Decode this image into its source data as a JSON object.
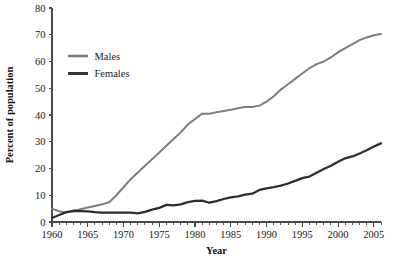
{
  "chart_data": {
    "type": "line",
    "title": "",
    "xlabel": "Year",
    "ylabel": "Percent of population",
    "xlim": [
      1960,
      2006
    ],
    "ylim": [
      0,
      80
    ],
    "ytick_values": [
      0,
      10,
      20,
      30,
      40,
      50,
      60,
      70,
      80
    ],
    "ytick_labels": [
      "0",
      "10",
      "20",
      "30",
      "40",
      "50",
      "60",
      "70",
      "80"
    ],
    "xtick_values": [
      1960,
      1965,
      1970,
      1975,
      1980,
      1985,
      1990,
      1995,
      2000,
      2005
    ],
    "xtick_labels": [
      "1960",
      "1965",
      "1970",
      "1975",
      "1980",
      "1985",
      "1990",
      "1995",
      "2000",
      "2005"
    ],
    "xtick_minor_step": 1,
    "grid": false,
    "legend_position": "upper-left-inside",
    "x": [
      1960,
      1961,
      1962,
      1963,
      1964,
      1965,
      1966,
      1967,
      1968,
      1969,
      1970,
      1971,
      1972,
      1973,
      1974,
      1975,
      1976,
      1977,
      1978,
      1979,
      1980,
      1981,
      1982,
      1983,
      1984,
      1985,
      1986,
      1987,
      1988,
      1989,
      1990,
      1991,
      1992,
      1993,
      1994,
      1995,
      1996,
      1997,
      1998,
      1999,
      2000,
      2001,
      2002,
      2003,
      2004,
      2005,
      2006
    ],
    "series": [
      {
        "name": "Males",
        "color": "#7d7d7d",
        "line_width": 2.0,
        "values": [
          5.0,
          4.0,
          3.5,
          4.0,
          4.8,
          5.4,
          6.0,
          6.6,
          7.4,
          10.0,
          13.0,
          16.0,
          18.5,
          21.0,
          23.5,
          26.0,
          28.5,
          31.0,
          33.5,
          36.5,
          38.5,
          40.5,
          40.5,
          41.0,
          41.5,
          42.0,
          42.5,
          43.0,
          43.0,
          43.5,
          45.0,
          47.0,
          49.5,
          51.5,
          53.5,
          55.5,
          57.5,
          59.0,
          60.0,
          61.5,
          63.5,
          65.0,
          66.5,
          68.0,
          69.0,
          69.8,
          70.3
        ]
      },
      {
        "name": "Females",
        "color": "#2e2e2e",
        "line_width": 2.3,
        "values": [
          1.5,
          2.6,
          3.7,
          4.2,
          4.1,
          4.0,
          3.7,
          3.5,
          3.5,
          3.5,
          3.5,
          3.5,
          3.2,
          3.8,
          4.6,
          5.3,
          6.4,
          6.2,
          6.6,
          7.4,
          7.9,
          8.0,
          7.2,
          7.8,
          8.6,
          9.2,
          9.6,
          10.2,
          10.6,
          12.0,
          12.6,
          13.0,
          13.6,
          14.4,
          15.4,
          16.4,
          17.0,
          18.4,
          19.8,
          21.0,
          22.5,
          23.8,
          24.5,
          25.6,
          26.8,
          28.2,
          29.4
        ]
      }
    ],
    "legend": [
      {
        "label": "Males",
        "color": "#7d7d7d"
      },
      {
        "label": "Females",
        "color": "#2e2e2e"
      }
    ]
  },
  "figure": {
    "background": "#ffffff"
  }
}
